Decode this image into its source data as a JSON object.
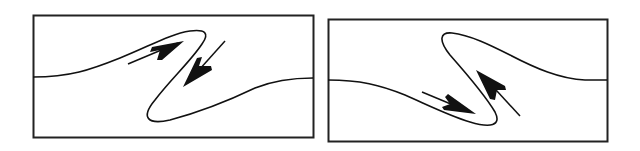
{
  "figure": {
    "stroke_color": "#111111",
    "background": "#ffffff",
    "panels": [
      {
        "id": "left",
        "fold_type": "Z-fold",
        "box": {
          "x": 33,
          "y": 15,
          "w": 280,
          "h": 122
        },
        "shear_sense": "sinistral-top-right / down-left pair",
        "arrows": [
          {
            "direction": "up-right",
            "position": "upper-limb"
          },
          {
            "direction": "down-left",
            "position": "middle-limb"
          }
        ]
      },
      {
        "id": "right",
        "fold_type": "S-fold",
        "box": {
          "x": 328,
          "y": 19,
          "w": 279,
          "h": 122
        },
        "arrows": [
          {
            "direction": "down-right",
            "position": "lower-limb"
          },
          {
            "direction": "up-left",
            "position": "middle-limb"
          }
        ]
      }
    ]
  }
}
